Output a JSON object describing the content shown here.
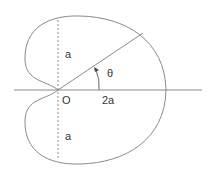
{
  "diagram": {
    "colors": {
      "stroke": "#8a8a8a",
      "text": "#333333",
      "background": "#ffffff"
    },
    "labels": {
      "upper_a": "a",
      "lower_a": "a",
      "origin": "O",
      "two_a": "2a",
      "theta": "θ"
    }
  }
}
